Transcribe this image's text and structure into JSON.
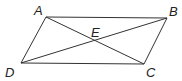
{
  "diagram": {
    "type": "parallelogram-with-diagonals",
    "points": {
      "A": {
        "x": 46,
        "y": 17,
        "label": "A",
        "lx": 34,
        "ly": 15
      },
      "B": {
        "x": 167,
        "y": 18,
        "label": "B",
        "lx": 169,
        "ly": 16
      },
      "C": {
        "x": 144,
        "y": 64,
        "label": "C",
        "lx": 146,
        "ly": 77
      },
      "D": {
        "x": 21,
        "y": 63,
        "label": "D",
        "lx": 5,
        "ly": 77
      },
      "E": {
        "x": 95,
        "y": 41,
        "label": "E",
        "lx": 91,
        "ly": 37
      }
    },
    "segments": [
      "AB",
      "BC",
      "CD",
      "DA",
      "AC",
      "BD"
    ]
  }
}
